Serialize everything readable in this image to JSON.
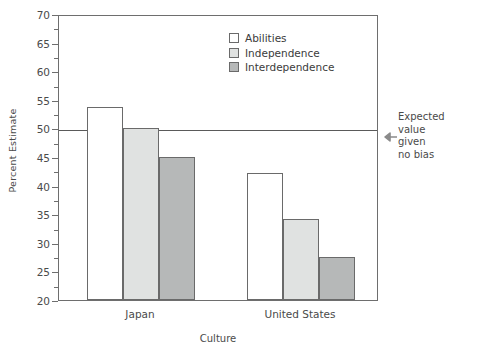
{
  "chart_data": {
    "type": "bar",
    "title": "",
    "xlabel": "Culture",
    "ylabel": "Percent Estimate",
    "categories": [
      "Japan",
      "United States"
    ],
    "series": [
      {
        "name": "Abilities",
        "values": [
          53.7,
          42.2
        ],
        "color": "#ffffff"
      },
      {
        "name": "Independence",
        "values": [
          50.0,
          34.1
        ],
        "color": "#e0e2e1"
      },
      {
        "name": "Interdependence",
        "values": [
          45.0,
          27.6
        ],
        "color": "#b6b8b8"
      }
    ],
    "ylim": [
      20,
      70
    ],
    "y_ticks": [
      20,
      25,
      30,
      35,
      40,
      45,
      50,
      55,
      60,
      65,
      70
    ],
    "y_tick_labels": [
      "20",
      "25",
      "30",
      "35",
      "40",
      "45",
      "50",
      "55",
      "60",
      "65",
      "70"
    ],
    "y_minor_ticks": [
      22.5,
      27.5,
      32.5,
      37.5,
      42.5,
      47.5,
      52.5,
      57.5,
      62.5,
      67.5
    ],
    "grid": false,
    "legend_position": "top-center",
    "reference_line": {
      "value": 50,
      "annotation": "Expected value given no bias",
      "annotation_lines": [
        "Expected",
        "value",
        "given",
        "no bias"
      ]
    }
  },
  "annotation": {
    "line1": "Expected",
    "line2": "value",
    "line3": "given",
    "line4": "no bias"
  }
}
